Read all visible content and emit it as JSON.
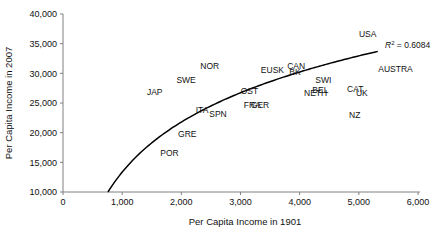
{
  "chart_data": {
    "type": "scatter",
    "title": "",
    "xlabel": "Per Capita Income in 1901",
    "ylabel": "Per Capita Income in 2007",
    "xlim": [
      0,
      6000
    ],
    "ylim": [
      10000,
      40000
    ],
    "xticks": [
      "0",
      "1,000",
      "2,000",
      "3,000",
      "4,000",
      "5,000",
      "6,000"
    ],
    "xtick_values": [
      0,
      1000,
      2000,
      3000,
      4000,
      5000,
      6000
    ],
    "yticks": [
      "10,000",
      "15,000",
      "20,000",
      "25,000",
      "30,000",
      "35,000",
      "40,000"
    ],
    "ytick_values": [
      10000,
      15000,
      20000,
      25000,
      30000,
      35000,
      40000
    ],
    "grid": false,
    "legend": null,
    "annotation": {
      "text_prefix": "R",
      "text_exponent": "2",
      "text_suffix": " = 0.6084",
      "full": "R2 = 0.6084",
      "x": 5450,
      "y": 33900
    },
    "trendline": {
      "type": "logarithmic",
      "x_start": 760,
      "x_end": 5320,
      "y_start": 10000,
      "y_end": 33700
    },
    "points": [
      {
        "label": "POR",
        "x": 1800,
        "y": 16000
      },
      {
        "label": "GRE",
        "x": 2100,
        "y": 19200
      },
      {
        "label": "ITA",
        "x": 2350,
        "y": 23300
      },
      {
        "label": "SPN",
        "x": 2620,
        "y": 22600
      },
      {
        "label": "JAP",
        "x": 1550,
        "y": 26400
      },
      {
        "label": "SWE",
        "x": 2080,
        "y": 28400
      },
      {
        "label": "NOR",
        "x": 2480,
        "y": 30700
      },
      {
        "label": "FRA",
        "x": 3200,
        "y": 24200
      },
      {
        "label": "GER",
        "x": 3330,
        "y": 24200
      },
      {
        "label": "OST",
        "x": 3150,
        "y": 26600
      },
      {
        "label": "EUSK",
        "x": 3540,
        "y": 30100
      },
      {
        "label": "CAN",
        "x": 3940,
        "y": 30700
      },
      {
        "label": "BK",
        "x": 3920,
        "y": 29800
      },
      {
        "label": "SWI",
        "x": 4400,
        "y": 28300
      },
      {
        "label": "BEL",
        "x": 4350,
        "y": 26700
      },
      {
        "label": "NETH",
        "x": 4270,
        "y": 26100
      },
      {
        "label": "CAT",
        "x": 4940,
        "y": 26800
      },
      {
        "label": "UK",
        "x": 5050,
        "y": 26100
      },
      {
        "label": "NZ",
        "x": 4930,
        "y": 22400
      },
      {
        "label": "USA",
        "x": 5150,
        "y": 36100
      },
      {
        "label": "AUSTRA",
        "x": 5620,
        "y": 30200
      }
    ]
  }
}
